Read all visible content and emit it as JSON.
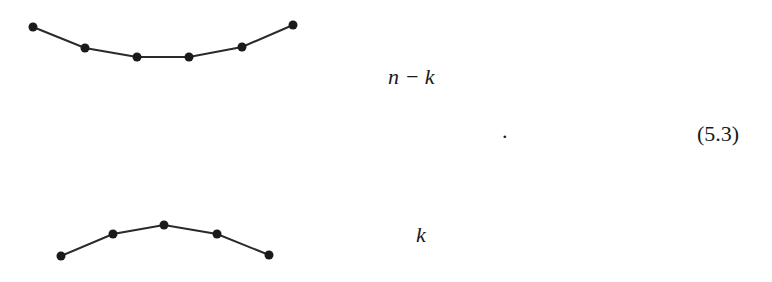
{
  "equation": {
    "number": "(5.3)",
    "trailing_punctuation": "."
  },
  "diagram": {
    "top_curve": {
      "label": "n − k",
      "points": [
        [
          33,
          27
        ],
        [
          85,
          48
        ],
        [
          137,
          57
        ],
        [
          189,
          57
        ],
        [
          242,
          47
        ],
        [
          293,
          25
        ]
      ]
    },
    "bottom_curve": {
      "label": "k",
      "points": [
        [
          61,
          256
        ],
        [
          113,
          234
        ],
        [
          164,
          225
        ],
        [
          217,
          234
        ],
        [
          269,
          255
        ]
      ]
    },
    "stroke_color": "#2a2a2a",
    "node_color": "#1a1a1a"
  }
}
